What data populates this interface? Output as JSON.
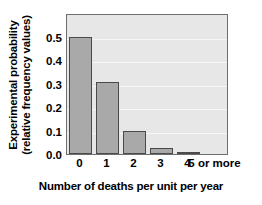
{
  "chart_data": {
    "type": "bar",
    "title": "",
    "categories": [
      "0",
      "1",
      "2",
      "3",
      "4",
      "5 or more"
    ],
    "values": [
      0.5,
      0.31,
      0.1,
      0.025,
      0.01,
      0.0
    ],
    "xlabel": "Number of deaths per unit per year",
    "ylabel": "Experimental probability (relative frequency values)",
    "ylabel_lines": [
      "Experimental probability",
      "(relative frequency values)"
    ],
    "yticks": [
      "0.0",
      "0.1",
      "0.2",
      "0.3",
      "0.4",
      "0.5"
    ],
    "ytick_values": [
      0.0,
      0.1,
      0.2,
      0.3,
      0.4,
      0.5
    ],
    "ylim": [
      0.0,
      0.603
    ],
    "xlim": [
      -0.5,
      5.5
    ],
    "grid": true,
    "legend": "none",
    "colors": {
      "bar_fill": "#a9a9a9",
      "bar_edge": "#4a4a4a",
      "plot_background": "#e7e7e7",
      "gridline": "#f6f6f6",
      "axis": "#6e6e6e",
      "text": "#000000",
      "figure_background": "#ffffff"
    }
  }
}
